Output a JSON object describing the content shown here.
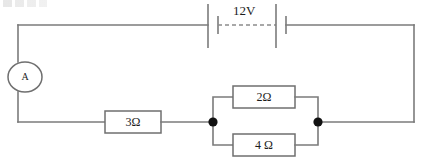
{
  "diagram": {
    "type": "electrical-schematic",
    "width": 421,
    "height": 160,
    "background_color": "#ffffff",
    "wire_color": "#7b7b7b",
    "node_color": "#111111",
    "label_color": "#1d1d1d"
  },
  "source": {
    "name": "battery",
    "label": "12V",
    "voltage_value": 12,
    "voltage_unit": "V",
    "cell_count": 2,
    "symbol": "battery-icon"
  },
  "meter": {
    "name": "ammeter",
    "label": "A",
    "symbol": "ammeter-icon",
    "shape": "ellipse"
  },
  "components": [
    {
      "id": "r-series",
      "label": "3Ω",
      "resistance_value": 3,
      "resistance_unit": "Ω",
      "connection": "series",
      "symbol": "resistor-icon"
    },
    {
      "id": "r-parallel-top",
      "label": "2Ω",
      "resistance_value": 2,
      "resistance_unit": "Ω",
      "connection": "parallel-top",
      "symbol": "resistor-icon"
    },
    {
      "id": "r-parallel-bottom",
      "label": "4 Ω",
      "resistance_value": 4,
      "resistance_unit": "Ω",
      "connection": "parallel-bottom",
      "symbol": "resistor-icon"
    }
  ],
  "junctions": [
    {
      "id": "node-left",
      "label": "",
      "x": 213,
      "y": 122
    },
    {
      "id": "node-right",
      "label": "",
      "x": 318,
      "y": 122
    }
  ]
}
